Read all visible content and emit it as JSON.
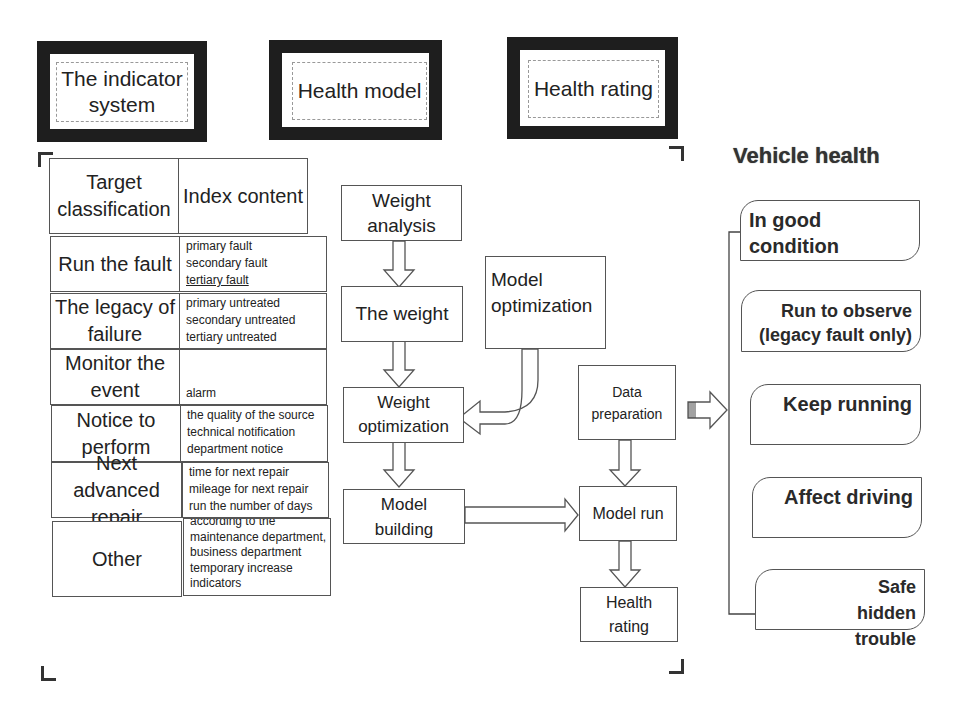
{
  "headers": {
    "indicator_system": "The indicator system",
    "health_model": "Health model",
    "health_rating": "Health rating"
  },
  "indicator_table": {
    "columns": [
      "Target classification",
      "Index content"
    ],
    "rows": [
      {
        "category": "Run the fault",
        "items": [
          "primary fault",
          "secondary fault",
          " tertiary fault"
        ]
      },
      {
        "category": "The legacy of failure",
        "items": [
          "primary untreated",
          "secondary untreated",
          "tertiary untreated"
        ]
      },
      {
        "category": "Monitor the event",
        "items": [
          "alarm",
          " warning",
          " forewarning"
        ]
      },
      {
        "category": "Notice to perform",
        "items": [
          "the quality of the source",
          "technical notification",
          "department notice"
        ]
      },
      {
        "category": "Next advanced repair",
        "items": [
          "time for next repair",
          "mileage for next repair",
          "run the number of days"
        ]
      },
      {
        "category": "Other",
        "items": [
          "according to the",
          "maintenance department,",
          "business department",
          "temporary increase",
          "indicators"
        ]
      }
    ]
  },
  "model_flow": {
    "weight_analysis": "Weight analysis",
    "the_weight": "The weight",
    "model_optimization": "Model optimization",
    "weight_optimization": "Weight optimization",
    "model_building": "Model building"
  },
  "rating_flow": {
    "data_preparation": "Data preparation",
    "model_run": "Model run",
    "health_rating": "Health rating"
  },
  "vehicle_health": {
    "title": "Vehicle health",
    "states": [
      "In good condition",
      "Run to observe (legacy fault only)",
      "Keep running",
      "Affect driving",
      "Safe hidden trouble"
    ]
  },
  "colors": {
    "header_border": "#1e1e1e",
    "box_border": "#555555",
    "text": "#222222",
    "fold_corner": "#666666"
  }
}
